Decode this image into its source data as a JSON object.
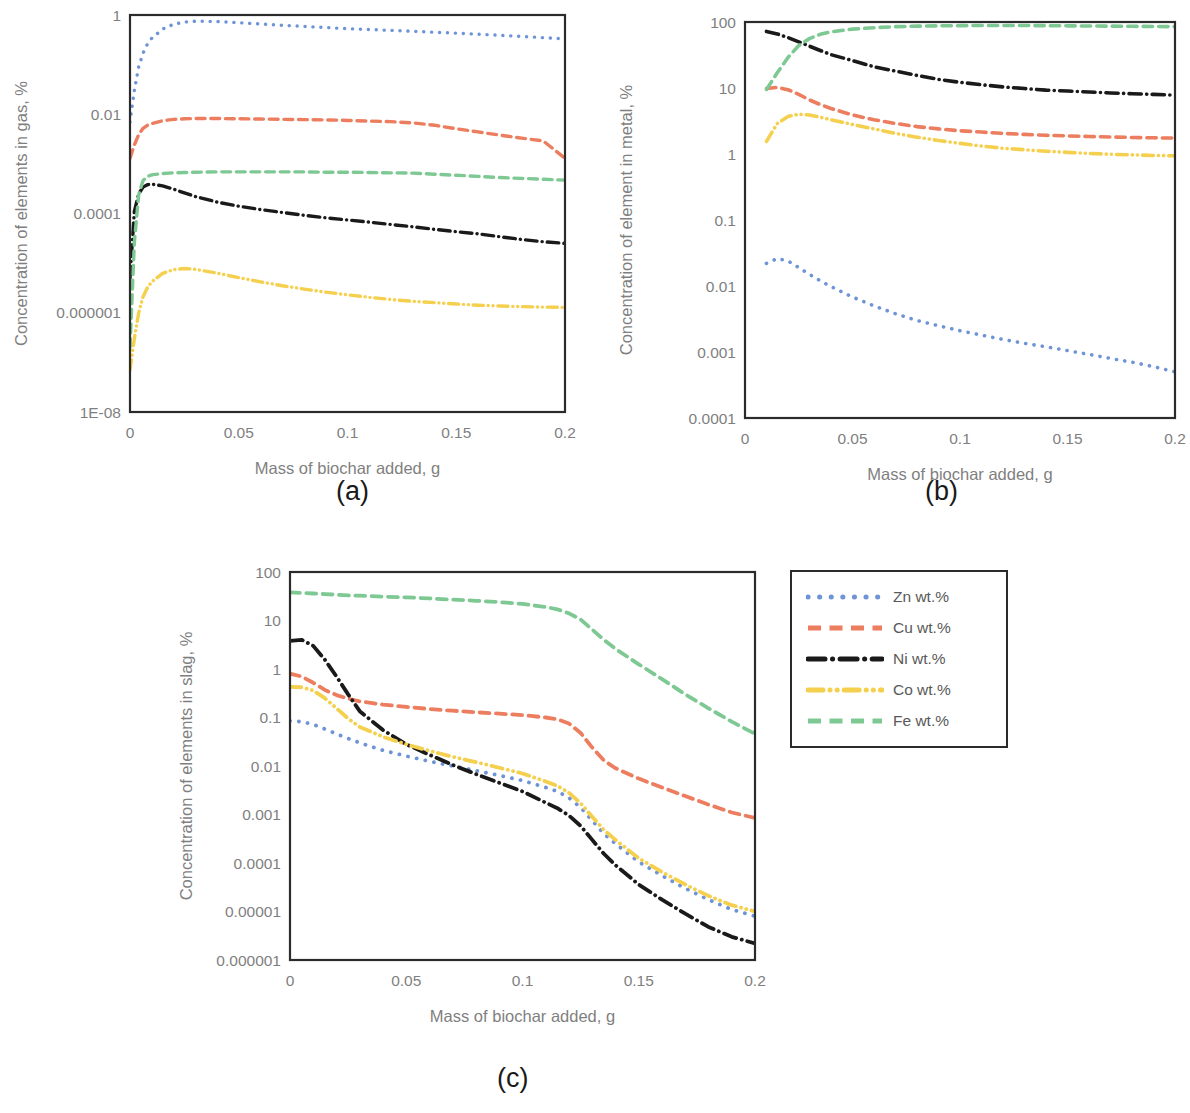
{
  "figure": {
    "x_axis_title": "Mass of biochar added, g",
    "x_ticks": [
      "0",
      "0.05",
      "0.1",
      "0.15",
      "0.2"
    ],
    "captions": {
      "a": "(a)",
      "b": "(b)",
      "c": "(c)"
    }
  },
  "legend": {
    "position": "right-of-panel-c",
    "items": [
      {
        "label": "Zn wt.%",
        "color": "#6e93d6",
        "style": "dotted"
      },
      {
        "label": "Cu wt.%",
        "color": "#ed7d5f",
        "style": "dashed"
      },
      {
        "label": "Ni wt.%",
        "color": "#1a1a1a",
        "style": "dash-dot"
      },
      {
        "label": "Co wt.%",
        "color": "#f5d04e",
        "style": "dash-dot-dot"
      },
      {
        "label": "Fe wt.%",
        "color": "#7ec993",
        "style": "dashed"
      }
    ]
  },
  "chart_data": [
    {
      "id": "a",
      "type": "line",
      "title": "",
      "caption": "(a)",
      "xlabel": "Mass of biochar added, g",
      "ylabel": "Concentration of elements in gas, %",
      "xlim": [
        0,
        0.2
      ],
      "ylim": [
        1e-08,
        1
      ],
      "yscale": "log",
      "xscale": "linear",
      "grid": false,
      "xtick_labels": [
        "0",
        "0.05",
        "0.1",
        "0.15",
        "0.2"
      ],
      "ytick_labels": [
        "1",
        "0.01",
        "0.0001",
        "0.000001",
        "1E-08"
      ],
      "ytick_values": [
        1,
        0.01,
        0.0001,
        1e-06,
        1e-08
      ],
      "x": [
        0,
        0.002,
        0.004,
        0.006,
        0.008,
        0.01,
        0.015,
        0.02,
        0.025,
        0.03,
        0.04,
        0.05,
        0.06,
        0.07,
        0.08,
        0.09,
        0.1,
        0.11,
        0.12,
        0.13,
        0.14,
        0.15,
        0.16,
        0.17,
        0.18,
        0.19,
        0.2
      ],
      "series": [
        {
          "name": "Zn wt.%",
          "color": "#6e93d6",
          "style": "dotted",
          "values": [
            0.007,
            0.03,
            0.09,
            0.17,
            0.26,
            0.34,
            0.52,
            0.65,
            0.72,
            0.75,
            0.74,
            0.7,
            0.66,
            0.62,
            0.59,
            0.56,
            0.53,
            0.51,
            0.49,
            0.47,
            0.45,
            0.43,
            0.41,
            0.39,
            0.37,
            0.35,
            0.33
          ]
        },
        {
          "name": "Cu wt.%",
          "color": "#ed7d5f",
          "style": "dashed",
          "values": [
            0.0013,
            0.0024,
            0.0039,
            0.0052,
            0.006,
            0.0065,
            0.0074,
            0.0079,
            0.0081,
            0.0082,
            0.0082,
            0.0081,
            0.008,
            0.0079,
            0.0078,
            0.0077,
            0.0075,
            0.0073,
            0.0071,
            0.0067,
            0.006,
            0.0051,
            0.0044,
            0.0038,
            0.0033,
            0.0029,
            0.0013
          ]
        },
        {
          "name": "Ni wt.%",
          "color": "#1a1a1a",
          "style": "dash-dot",
          "values": [
            5e-06,
            0.00011,
            0.00025,
            0.00034,
            0.00038,
            0.00039,
            0.00036,
            0.00031,
            0.00026,
            0.00022,
            0.00017,
            0.00014,
            0.00012,
            0.000105,
            9.2e-05,
            8.2e-05,
            7.4e-05,
            6.7e-05,
            6e-05,
            5.4e-05,
            4.8e-05,
            4.3e-05,
            3.9e-05,
            3.4e-05,
            3e-05,
            2.7e-05,
            2.5e-05
          ]
        },
        {
          "name": "Co wt.%",
          "color": "#f5d04e",
          "style": "dash-dot-dot",
          "values": [
            7e-08,
            3e-07,
            1e-06,
            2.1e-06,
            3.2e-06,
            4.2e-06,
            6.2e-06,
            7.4e-06,
            7.8e-06,
            7.5e-06,
            6.3e-06,
            5.1e-06,
            4.2e-06,
            3.5e-06,
            3e-06,
            2.6e-06,
            2.3e-06,
            2.05e-06,
            1.85e-06,
            1.7e-06,
            1.6e-06,
            1.5e-06,
            1.42e-06,
            1.37e-06,
            1.33e-06,
            1.3e-06,
            1.28e-06
          ]
        },
        {
          "name": "Fe wt.%",
          "color": "#7ec993",
          "style": "dashed",
          "values": [
            2e-07,
            2.6e-05,
            0.00024,
            0.00046,
            0.00056,
            0.0006,
            0.00064,
            0.00066,
            0.00067,
            0.00068,
            0.00069,
            0.00069,
            0.00069,
            0.00069,
            0.00069,
            0.00068,
            0.00068,
            0.00067,
            0.00066,
            0.00065,
            0.00062,
            0.00059,
            0.00056,
            0.00053,
            0.00051,
            0.00049,
            0.00047
          ]
        }
      ]
    },
    {
      "id": "b",
      "type": "line",
      "title": "",
      "caption": "(b)",
      "xlabel": "Mass of biochar added, g",
      "ylabel": "Concentration of element in metal, %",
      "xlim": [
        0,
        0.2
      ],
      "ylim": [
        0.0001,
        100
      ],
      "yscale": "log",
      "xscale": "linear",
      "grid": false,
      "xtick_labels": [
        "0",
        "0.05",
        "0.1",
        "0.15",
        "0.2"
      ],
      "ytick_labels": [
        "100",
        "10",
        "1",
        "0.1",
        "0.01",
        "0.001",
        "0.0001"
      ],
      "ytick_values": [
        100,
        10,
        1,
        0.1,
        0.01,
        0.001,
        0.0001
      ],
      "x": [
        0.01,
        0.015,
        0.02,
        0.025,
        0.03,
        0.035,
        0.04,
        0.05,
        0.06,
        0.07,
        0.08,
        0.09,
        0.1,
        0.11,
        0.12,
        0.13,
        0.14,
        0.15,
        0.16,
        0.17,
        0.18,
        0.19,
        0.2
      ],
      "series": [
        {
          "name": "Zn wt.%",
          "color": "#6e93d6",
          "style": "dotted",
          "values": [
            0.022,
            0.026,
            0.024,
            0.019,
            0.015,
            0.012,
            0.0098,
            0.0068,
            0.005,
            0.0038,
            0.003,
            0.0025,
            0.0021,
            0.0018,
            0.00155,
            0.00135,
            0.0012,
            0.00105,
            0.00092,
            0.0008,
            0.0007,
            0.0006,
            0.0005
          ]
        },
        {
          "name": "Cu wt.%",
          "color": "#ed7d5f",
          "style": "dashed",
          "values": [
            9.8,
            10.2,
            9.4,
            8.0,
            6.6,
            5.6,
            4.9,
            3.9,
            3.3,
            2.9,
            2.6,
            2.4,
            2.25,
            2.15,
            2.05,
            1.98,
            1.92,
            1.88,
            1.84,
            1.81,
            1.78,
            1.76,
            1.74
          ]
        },
        {
          "name": "Ni wt.%",
          "color": "#1a1a1a",
          "style": "dash-dot",
          "values": [
            72,
            66,
            58,
            50,
            43,
            37,
            32,
            26,
            21,
            18,
            15.5,
            13.5,
            12.2,
            11.2,
            10.4,
            9.8,
            9.3,
            9.0,
            8.7,
            8.4,
            8.2,
            8.0,
            7.8
          ]
        },
        {
          "name": "Co wt.%",
          "color": "#f5d04e",
          "style": "dash-dot-dot",
          "values": [
            1.55,
            2.9,
            3.7,
            4.0,
            3.9,
            3.6,
            3.3,
            2.8,
            2.4,
            2.05,
            1.8,
            1.6,
            1.45,
            1.32,
            1.22,
            1.16,
            1.1,
            1.06,
            1.02,
            0.99,
            0.97,
            0.95,
            0.94
          ]
        },
        {
          "name": "Fe wt.%",
          "color": "#7ec993",
          "style": "dashed",
          "values": [
            9.5,
            17,
            29,
            44,
            56,
            65,
            71,
            78,
            82,
            85,
            86.5,
            87.5,
            88,
            88.5,
            88.5,
            88.5,
            88,
            87.5,
            87,
            86.5,
            86,
            85.5,
            85
          ]
        }
      ]
    },
    {
      "id": "c",
      "type": "line",
      "title": "",
      "caption": "(c)",
      "xlabel": "Mass of biochar added, g",
      "ylabel": "Concentration of elements in slag, %",
      "xlim": [
        0,
        0.2
      ],
      "ylim": [
        1e-06,
        100
      ],
      "yscale": "log",
      "xscale": "linear",
      "grid": false,
      "xtick_labels": [
        "0",
        "0.05",
        "0.1",
        "0.15",
        "0.2"
      ],
      "ytick_labels": [
        "100",
        "10",
        "1",
        "0.1",
        "0.01",
        "0.001",
        "0.0001",
        "0.00001",
        "0.000001"
      ],
      "ytick_values": [
        100,
        10,
        1,
        0.1,
        0.01,
        0.001,
        0.0001,
        1e-05,
        1e-06
      ],
      "x": [
        0,
        0.005,
        0.01,
        0.015,
        0.02,
        0.025,
        0.03,
        0.04,
        0.05,
        0.06,
        0.07,
        0.08,
        0.09,
        0.1,
        0.11,
        0.115,
        0.12,
        0.125,
        0.13,
        0.135,
        0.14,
        0.15,
        0.16,
        0.17,
        0.18,
        0.19,
        0.2
      ],
      "series": [
        {
          "name": "Zn wt.%",
          "color": "#6e93d6",
          "style": "dotted",
          "values": [
            0.085,
            0.082,
            0.072,
            0.058,
            0.046,
            0.037,
            0.03,
            0.021,
            0.016,
            0.0125,
            0.01,
            0.008,
            0.0064,
            0.005,
            0.0036,
            0.003,
            0.0022,
            0.0014,
            0.00075,
            0.0004,
            0.00025,
            0.000105,
            5.5e-05,
            3e-05,
            1.75e-05,
            1.1e-05,
            8e-06
          ]
        },
        {
          "name": "Cu wt.%",
          "color": "#ed7d5f",
          "style": "dashed",
          "values": [
            0.8,
            0.7,
            0.52,
            0.37,
            0.29,
            0.245,
            0.215,
            0.185,
            0.165,
            0.15,
            0.138,
            0.128,
            0.12,
            0.112,
            0.1,
            0.092,
            0.075,
            0.048,
            0.024,
            0.013,
            0.009,
            0.0055,
            0.0036,
            0.0024,
            0.0016,
            0.0011,
            0.00085
          ]
        },
        {
          "name": "Ni wt.%",
          "color": "#1a1a1a",
          "style": "dash-dot",
          "values": [
            3.8,
            4.0,
            3.0,
            1.55,
            0.7,
            0.3,
            0.135,
            0.055,
            0.028,
            0.017,
            0.0105,
            0.0068,
            0.0045,
            0.003,
            0.00175,
            0.00135,
            0.00095,
            0.00058,
            0.0003,
            0.000155,
            9e-05,
            3.6e-05,
            1.75e-05,
            9e-06,
            4.8e-06,
            3e-06,
            2.2e-06
          ]
        },
        {
          "name": "Co wt.%",
          "color": "#f5d04e",
          "style": "dash-dot-dot",
          "values": [
            0.43,
            0.42,
            0.36,
            0.25,
            0.155,
            0.095,
            0.064,
            0.04,
            0.028,
            0.0205,
            0.0155,
            0.012,
            0.0092,
            0.007,
            0.0048,
            0.0039,
            0.0028,
            0.0017,
            0.0009,
            0.00048,
            0.0003,
            0.000125,
            6.5e-05,
            3.6e-05,
            2.1e-05,
            1.35e-05,
            1e-05
          ]
        },
        {
          "name": "Fe wt.%",
          "color": "#7ec993",
          "style": "dashed",
          "values": [
            38,
            37,
            36,
            35,
            34,
            33,
            32.5,
            31,
            30,
            28.5,
            27,
            25.5,
            24,
            22,
            19,
            17,
            14,
            10.5,
            6.5,
            4.0,
            2.6,
            1.25,
            0.62,
            0.3,
            0.155,
            0.082,
            0.046
          ]
        }
      ]
    }
  ]
}
